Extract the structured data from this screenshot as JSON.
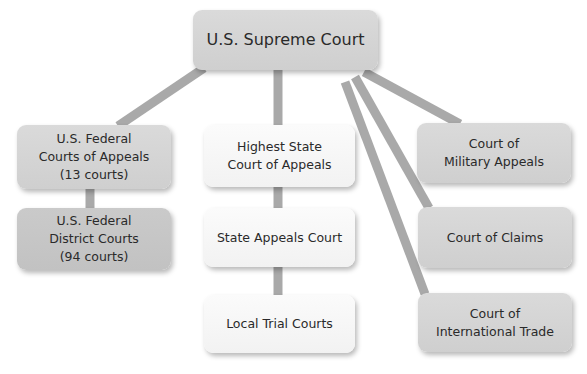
{
  "diagram": {
    "title": "U.S. Supreme Court",
    "nodes": {
      "supreme": "U.S. Supreme Court",
      "fed_appeals": "U.S. Federal\nCourts of Appeals\n(13 courts)",
      "district": "U.S. Federal\nDistrict Courts\n(94 courts)",
      "highest_state": "Highest State\nCourt of Appeals",
      "state_appeals": "State Appeals Court",
      "local_trial": "Local Trial Courts",
      "military": "Court of\nMilitary Appeals",
      "claims": "Court of Claims",
      "intl_trade": "Court of\nInternational Trade"
    },
    "edges": [
      [
        "supreme",
        "fed_appeals"
      ],
      [
        "supreme",
        "highest_state"
      ],
      [
        "supreme",
        "military"
      ],
      [
        "supreme",
        "claims"
      ],
      [
        "supreme",
        "intl_trade"
      ],
      [
        "fed_appeals",
        "district"
      ],
      [
        "highest_state",
        "state_appeals"
      ],
      [
        "state_appeals",
        "local_trial"
      ]
    ],
    "colors": {
      "federal_box": "#d4d4d4",
      "district_box": "#c6c6c6",
      "state_box": "#f6f6f6",
      "connector": "#a9a9a9",
      "text": "#2a2a2a"
    }
  }
}
